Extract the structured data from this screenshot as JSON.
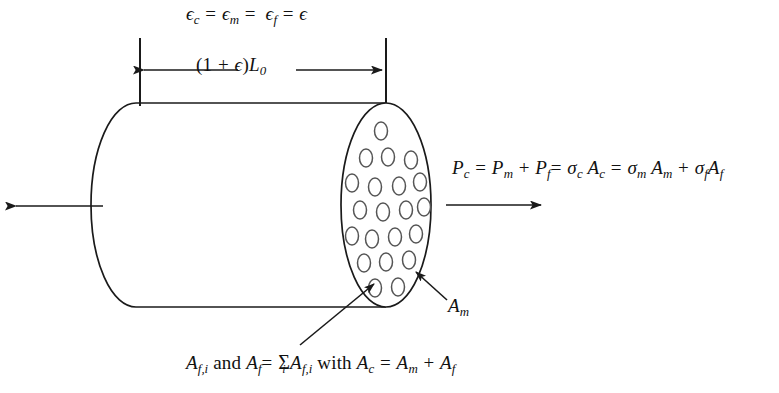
{
  "figure": {
    "background_color": "#ffffff",
    "line_color": "#1a1a1a",
    "fiber_outline_color": "#555555"
  },
  "strain_equation": {
    "name": "iso-strain-condition",
    "eps": "ϵ",
    "sub_c": "c",
    "sub_m": "m",
    "sub_f": "f",
    "eq": "=",
    "plain_text": "ϵc = ϵm = ϵf = ϵ"
  },
  "dimension": {
    "name": "stretched-length",
    "open_paren": "(",
    "one": "1",
    "plus": "+",
    "eps": "ϵ",
    "close_paren": ")",
    "L": "L",
    "sub_zero": "0",
    "plain_text": "(1 + ϵ)L0"
  },
  "load_equation": {
    "name": "load-partition",
    "P": "P",
    "sigma": "σ",
    "A": "A",
    "sub_c": "c",
    "sub_m": "m",
    "sub_f": "f",
    "eq": "=",
    "plus": "+",
    "plain_text": "Pc = Pm + Pf = σc Ac = σm Am + σf Af"
  },
  "matrix_callout": {
    "name": "matrix-area",
    "A": "A",
    "sub_m": "m",
    "plain_text": "Am"
  },
  "fiber_caption": {
    "name": "fiber-area-sum",
    "A": "A",
    "sub_fi": "f,i",
    "and": "and",
    "sub_f": "f",
    "eq": "=",
    "sum": "Σ",
    "sum_index": "i",
    "with": "with",
    "sub_c": "c",
    "sub_m": "m",
    "plus": "+",
    "plain_text": "Af,i and Af = Σi Af,i with Ac = Am + Af"
  },
  "geometry": {
    "cylinder_top_y": 103,
    "cylinder_bottom_y": 307,
    "left_cap_x": 101,
    "right_face_center_x": 386,
    "right_face_rx": 45,
    "right_face_ry": 102,
    "left_force_arrow": {
      "from_x": 103,
      "to_x": 12,
      "y": 206
    },
    "right_force_arrow": {
      "from_x": 446,
      "to_x": 545,
      "y": 205
    },
    "dimension_arrow": {
      "left_x": 140,
      "right_x": 386,
      "y": 70
    },
    "extension_line_top_y": 38,
    "extension_line_bottom_y": 106
  },
  "fibers": {
    "name": "fiber-cross-sections",
    "count": 21,
    "rx": 6.5,
    "ry": 9,
    "positions": [
      [
        381,
        131
      ],
      [
        366,
        158
      ],
      [
        388,
        157
      ],
      [
        411,
        160
      ],
      [
        352,
        183
      ],
      [
        375,
        187
      ],
      [
        399,
        186
      ],
      [
        420,
        182
      ],
      [
        360,
        210
      ],
      [
        383,
        212
      ],
      [
        406,
        210
      ],
      [
        424,
        207
      ],
      [
        352,
        236
      ],
      [
        372,
        239
      ],
      [
        395,
        237
      ],
      [
        416,
        234
      ],
      [
        364,
        263
      ],
      [
        386,
        262
      ],
      [
        409,
        260
      ],
      [
        375,
        288
      ],
      [
        398,
        287
      ]
    ]
  },
  "leaders": {
    "fiber_leader": {
      "name": "fiber-leader-line",
      "from_x": 300,
      "from_y": 345,
      "to_x": 372,
      "to_y": 283
    },
    "matrix_leader": {
      "name": "matrix-leader-line",
      "from_x": 447,
      "from_y": 300,
      "to_x": 414,
      "to_y": 271
    }
  }
}
